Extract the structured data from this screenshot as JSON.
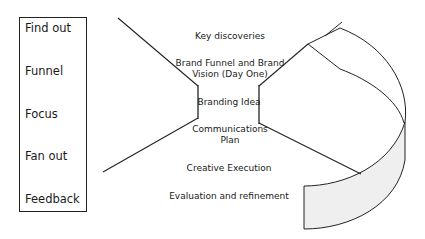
{
  "stages": [
    {
      "label": "Find out"
    },
    {
      "label": "Funnel"
    },
    {
      "label": "Focus"
    },
    {
      "label": "Fan out"
    },
    {
      "label": "Feedback"
    }
  ],
  "steps": [
    {
      "line1": "Key discoveries",
      "line2": ""
    },
    {
      "line1": "Brand Funnel and Brand",
      "line2": "Vision (Day One)"
    },
    {
      "line1": "Branding Idea",
      "line2": ""
    },
    {
      "line1": "Communications",
      "line2": "Plan"
    },
    {
      "line1": "Creative Execution",
      "line2": ""
    },
    {
      "line1": "Evaluation and refinement",
      "line2": ""
    }
  ],
  "colors": {
    "stroke": "#222222",
    "band_fill": "#efefef"
  }
}
